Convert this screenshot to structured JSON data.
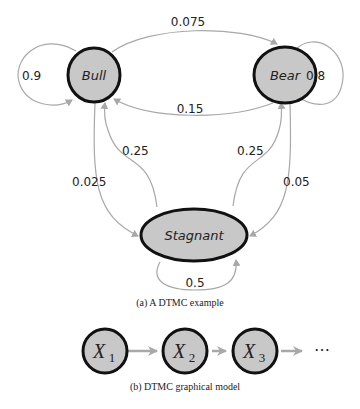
{
  "diagram_a": {
    "caption": "(a) A DTMC example",
    "nodes": [
      {
        "id": "bull",
        "label": "Bull"
      },
      {
        "id": "bear",
        "label": "Bear"
      },
      {
        "id": "stagnant",
        "label": "Stagnant"
      }
    ],
    "edges": [
      {
        "from": "bull",
        "to": "bull",
        "label": "0.9"
      },
      {
        "from": "bull",
        "to": "bear",
        "label": "0.075"
      },
      {
        "from": "bull",
        "to": "stagnant",
        "label": "0.025"
      },
      {
        "from": "bear",
        "to": "bear",
        "label": "0.8"
      },
      {
        "from": "bear",
        "to": "bull",
        "label": "0.15"
      },
      {
        "from": "bear",
        "to": "stagnant",
        "label": "0.05"
      },
      {
        "from": "stagnant",
        "to": "stagnant",
        "label": "0.5"
      },
      {
        "from": "stagnant",
        "to": "bull",
        "label": "0.25"
      },
      {
        "from": "stagnant",
        "to": "bear",
        "label": "0.25"
      }
    ]
  },
  "diagram_b": {
    "caption": "(b) DTMC graphical model",
    "nodes": [
      {
        "var": "X",
        "sub": "1"
      },
      {
        "var": "X",
        "sub": "2"
      },
      {
        "var": "X",
        "sub": "3"
      }
    ],
    "ellipsis": "⋯"
  }
}
